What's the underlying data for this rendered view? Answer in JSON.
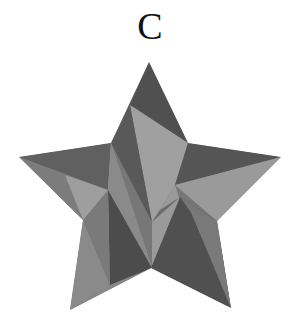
{
  "label": "C",
  "star": {
    "outline": "149,62 188,143 281,157 217,221 231,308 151,268 70,310 83,220 19,157 111,143",
    "colors": {
      "dark": "#555555",
      "darker": "#4a4a4a",
      "mid": "#7a7a7a",
      "light": "#a2a2a2",
      "mid_light": "#8c8c8c"
    },
    "facets": [
      {
        "points": "149,62 188,143 130,105",
        "fill": "#505050"
      },
      {
        "points": "149,62 130,105 111,143",
        "fill": "#5c5c5c"
      },
      {
        "points": "130,105 188,143 175,185 152,222",
        "fill": "#a0a0a0"
      },
      {
        "points": "111,143 130,105 152,222",
        "fill": "#595959"
      },
      {
        "points": "188,143 281,157 175,185",
        "fill": "#555555"
      },
      {
        "points": "175,185 281,157 217,221",
        "fill": "#9a9a9a"
      },
      {
        "points": "19,157 111,143 108,190",
        "fill": "#606060"
      },
      {
        "points": "19,157 108,190 83,220",
        "fill": "#7c7c7c"
      },
      {
        "points": "65,175 108,190 111,143 152,268 83,220",
        "fill": "#9e9e9e"
      },
      {
        "points": "108,190 111,143 152,268",
        "fill": "#8a8a8a"
      },
      {
        "points": "108,190 152,268 110,285",
        "fill": "#4c4c4c"
      },
      {
        "points": "83,220 110,285 70,310",
        "fill": "#8a8a8a"
      },
      {
        "points": "83,220 108,190 110,285",
        "fill": "#7a7a7a"
      },
      {
        "points": "110,285 152,268 70,310",
        "fill": "#888888"
      },
      {
        "points": "152,222 175,185 180,200 152,268",
        "fill": "#9a9a9a"
      },
      {
        "points": "152,222 180,197 160,210",
        "fill": "#6a6a6a"
      },
      {
        "points": "180,197 217,221 231,308 151,268",
        "fill": "#505050"
      },
      {
        "points": "180,197 217,221 200,225",
        "fill": "#777777"
      },
      {
        "points": "190,210 217,221 231,308",
        "fill": "#7a7a7a"
      }
    ]
  }
}
